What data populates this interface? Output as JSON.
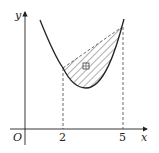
{
  "diagram": {
    "type": "function-graph",
    "axes": {
      "x_label": "x",
      "y_label": "y",
      "origin_label": "O"
    },
    "x_ticks": [
      {
        "value": "2"
      },
      {
        "value": "5"
      }
    ],
    "region_marker": "□",
    "colors": {
      "curve": "#222222",
      "hatch": "#333333",
      "dashed": "#444444",
      "background": "#ffffff"
    }
  }
}
